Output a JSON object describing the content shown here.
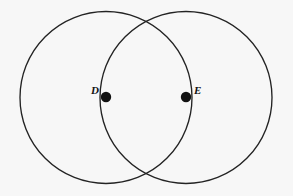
{
  "canvas": {
    "width": 293,
    "height": 196,
    "background_color": "#f7f7f7",
    "stroke_color": "#232323",
    "stroke_width": 1.35,
    "point_color": "#111111"
  },
  "figure": {
    "type": "two-intersecting-circles"
  },
  "circles": [
    {
      "name": "circle-d",
      "center_label": "D",
      "cx": 106,
      "cy": 97.5,
      "r": 86
    },
    {
      "name": "circle-e",
      "center_label": "E",
      "cx": 186,
      "cy": 97.5,
      "r": 86
    }
  ],
  "points": [
    {
      "name": "point-d",
      "label": "D",
      "cx": 106,
      "cy": 97,
      "r": 5.2,
      "label_x": 99,
      "label_y": 94,
      "label_side": "left"
    },
    {
      "name": "point-e",
      "label": "E",
      "cx": 186,
      "cy": 97,
      "r": 5.2,
      "label_x": 194,
      "label_y": 94,
      "label_side": "right"
    }
  ],
  "intersections": [
    {
      "name": "intersection-top",
      "x": 146,
      "y": 24
    },
    {
      "name": "intersection-bottom",
      "x": 146,
      "y": 172
    }
  ]
}
